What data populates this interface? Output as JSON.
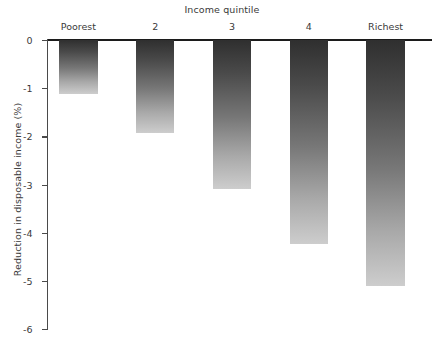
{
  "chart_data": {
    "type": "bar",
    "title": "Income quintile",
    "subtitle": "",
    "xlabel": "Income quintile",
    "ylabel": "Reduction in disposable income (%)",
    "categories": [
      "Poorest",
      "2",
      "3",
      "4",
      "Richest"
    ],
    "values": [
      -1.13,
      -1.92,
      -3.1,
      -4.23,
      -5.1
    ],
    "ylim": [
      -6,
      0
    ],
    "yticks": [
      0,
      -1,
      -2,
      -3,
      -4,
      -5,
      -6
    ],
    "ytick_labels": [
      "0",
      "-1",
      "-2",
      "-3",
      "-4",
      "-5",
      "-6"
    ],
    "grid": false,
    "legend": null,
    "series": [
      {
        "name": "Reduction in disposable income (%)",
        "values": [
          -1.13,
          -1.92,
          -3.1,
          -4.23,
          -5.1
        ]
      }
    ],
    "annotations": [],
    "colors": {
      "bar_gradient_top": "#2f2f2f",
      "bar_gradient_bottom": "#cdcdcd",
      "axis": "#1c1c1c",
      "text": "#3a3a3a",
      "background": "#ffffff"
    }
  }
}
